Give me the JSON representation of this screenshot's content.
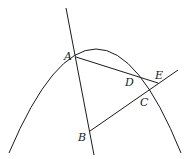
{
  "diagram": {
    "type": "geometry",
    "curve": "parabola (downward-opening)",
    "points": {
      "A": {
        "label": "A",
        "x": 76,
        "y": 57,
        "label_x": 64,
        "label_y": 60
      },
      "B": {
        "label": "B",
        "x": 90,
        "y": 131,
        "label_x": 78,
        "label_y": 141
      },
      "C": {
        "label": "C",
        "x": 146,
        "y": 92,
        "label_x": 140,
        "label_y": 106
      },
      "D": {
        "label": "D",
        "x": 134,
        "y": 75,
        "label_x": 125,
        "label_y": 86
      },
      "E": {
        "label": "E",
        "x": 158,
        "y": 83,
        "label_x": 155,
        "label_y": 79
      }
    },
    "segments": [
      {
        "name": "line-AB",
        "from": [
          66,
          8
        ],
        "to": [
          94,
          155
        ]
      },
      {
        "name": "segment-AE",
        "from": [
          76,
          57
        ],
        "to": [
          158,
          83
        ]
      },
      {
        "name": "line-BE",
        "from": [
          90,
          131
        ],
        "to": [
          178,
          70
        ]
      }
    ]
  }
}
